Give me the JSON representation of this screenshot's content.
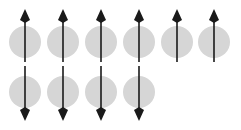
{
  "figure": {
    "width": 241,
    "height": 130,
    "background_color": "#ffffff"
  },
  "style": {
    "circle_fill": "#d6d6d6",
    "arrow_color": "#1a1a1a",
    "arrow_line_width": 1.6,
    "circle_radius": 16
  },
  "layout": {
    "column_x": [
      25,
      63,
      101,
      139,
      177,
      214
    ],
    "row_center_y": [
      42,
      92
    ],
    "column_count_top": 6,
    "column_count_bottom": 4
  },
  "arrows": {
    "up": {
      "name": "spin-up-arrow",
      "direction": "up",
      "head_tip_y": 9,
      "tail_y": 62,
      "head_half_width": 5,
      "head_length": 11
    },
    "down": {
      "name": "spin-down-arrow",
      "direction": "down",
      "head_tip_y": 121,
      "tail_y": 66,
      "head_half_width": 5,
      "head_length": 11
    }
  },
  "sites": {
    "top_row": [
      {
        "id": "site-r1c1",
        "column": 1,
        "row": 1,
        "cx": 25,
        "cy": 42,
        "spin": "up"
      },
      {
        "id": "site-r1c2",
        "column": 2,
        "row": 1,
        "cx": 63,
        "cy": 42,
        "spin": "up"
      },
      {
        "id": "site-r1c3",
        "column": 3,
        "row": 1,
        "cx": 101,
        "cy": 42,
        "spin": "up"
      },
      {
        "id": "site-r1c4",
        "column": 4,
        "row": 1,
        "cx": 139,
        "cy": 42,
        "spin": "up"
      },
      {
        "id": "site-r1c5",
        "column": 5,
        "row": 1,
        "cx": 177,
        "cy": 42,
        "spin": "up"
      },
      {
        "id": "site-r1c6",
        "column": 6,
        "row": 1,
        "cx": 214,
        "cy": 42,
        "spin": "up"
      }
    ],
    "bottom_row": [
      {
        "id": "site-r2c1",
        "column": 1,
        "row": 2,
        "cx": 25,
        "cy": 92,
        "spin": "down"
      },
      {
        "id": "site-r2c2",
        "column": 2,
        "row": 2,
        "cx": 63,
        "cy": 92,
        "spin": "down"
      },
      {
        "id": "site-r2c3",
        "column": 3,
        "row": 2,
        "cx": 101,
        "cy": 92,
        "spin": "down"
      },
      {
        "id": "site-r2c4",
        "column": 4,
        "row": 2,
        "cx": 139,
        "cy": 92,
        "spin": "down"
      }
    ]
  }
}
